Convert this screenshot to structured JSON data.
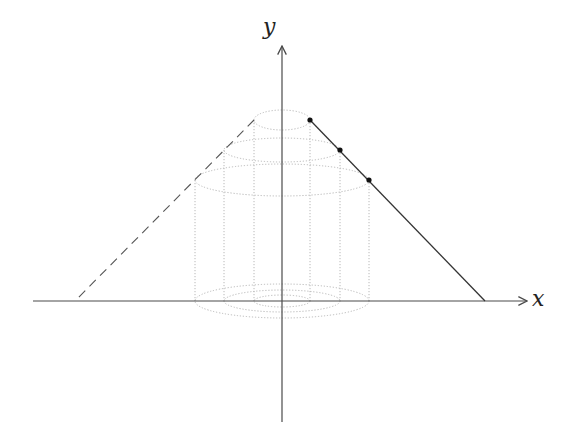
{
  "diagram": {
    "type": "solid-of-revolution-cylindrical-shells",
    "axes": {
      "x_label": "x",
      "y_label": "y",
      "origin_px": [
        282,
        301
      ],
      "x_axis_px": {
        "from": 33,
        "to": 527
      },
      "y_axis_px": {
        "from": 422,
        "to": 46
      }
    },
    "colors": {
      "axis": "#4a4a4a",
      "line": "#333333",
      "dashed_line": "#555555",
      "dotted_shells": "#b8b8b8",
      "point": "#111111",
      "background": "#ffffff"
    },
    "solid_line": {
      "from_px": [
        310,
        120
      ],
      "to_px": [
        485,
        301
      ]
    },
    "dashed_line": {
      "from_px": [
        254,
        120
      ],
      "to_px": [
        75,
        301
      ]
    },
    "points": [
      {
        "px": [
          310,
          120
        ]
      },
      {
        "px": [
          340,
          150
        ]
      },
      {
        "px": [
          369,
          180
        ]
      }
    ],
    "shells": [
      {
        "radius_px": 28,
        "top_y": 120,
        "top_ry": 10,
        "bottom_y": 301,
        "bottom_ry": 6
      },
      {
        "radius_px": 58,
        "top_y": 150,
        "top_ry": 12,
        "bottom_y": 301,
        "bottom_ry": 11
      },
      {
        "radius_px": 87,
        "top_y": 180,
        "top_ry": 16,
        "bottom_y": 301,
        "bottom_ry": 17
      }
    ]
  }
}
